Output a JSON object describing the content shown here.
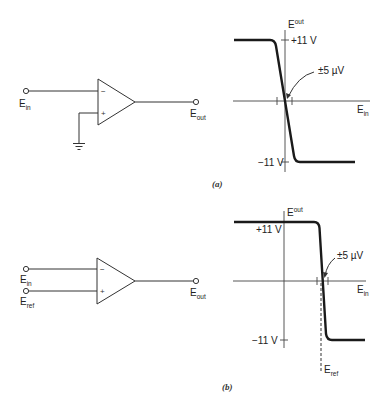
{
  "figure_a": {
    "caption": "(a)",
    "circuit": {
      "input_label": "E",
      "input_sub": "in",
      "output_label": "E",
      "output_sub": "out",
      "inverting_sign": "−",
      "noninverting_sign": "+",
      "noninverting_connection": "ground"
    },
    "graph": {
      "y_axis_label": "E",
      "y_axis_sub": "out",
      "x_axis_label": "E",
      "x_axis_sub": "in",
      "pos_sat": "+11  V",
      "neg_sat": "−11  V",
      "window_annotation": "±5 µV"
    }
  },
  "figure_b": {
    "caption": "(b)",
    "circuit": {
      "input_label": "E",
      "input_sub": "in",
      "ref_label": "E",
      "ref_sub": "ref",
      "output_label": "E",
      "output_sub": "out",
      "inverting_sign": "−",
      "noninverting_sign": "+"
    },
    "graph": {
      "y_axis_label": "E",
      "y_axis_sub": "out",
      "x_axis_label": "E",
      "x_axis_sub": "in",
      "pos_sat": "+11  V",
      "neg_sat": "−11  V",
      "window_annotation": "±5 µV",
      "ref_label": "E",
      "ref_sub": "ref"
    }
  }
}
